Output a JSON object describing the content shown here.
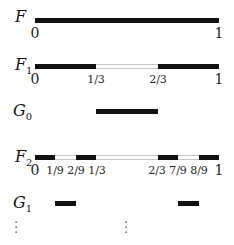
{
  "rows": {
    "F": {
      "label": "F",
      "sub": ""
    },
    "F1": {
      "label": "F",
      "sub": "1"
    },
    "G0": {
      "label": "G",
      "sub": "0"
    },
    "F2": {
      "label": "F",
      "sub": "2"
    },
    "G1": {
      "label": "G",
      "sub": "1"
    }
  },
  "ticks": {
    "F": [
      "0",
      "1"
    ],
    "F1": [
      "0",
      "1/3",
      "2/3",
      "1"
    ],
    "F2": [
      "0",
      "1/9",
      "2/9",
      "1/3",
      "2/3",
      "7/9",
      "8/9",
      "1"
    ]
  },
  "segments": {
    "F": [
      [
        0,
        1
      ]
    ],
    "F1": [
      [
        0,
        0.3333
      ],
      [
        0.6667,
        1
      ]
    ],
    "G0": [
      [
        0.3333,
        0.6667
      ]
    ],
    "F2": [
      [
        0,
        0.1111
      ],
      [
        0.2222,
        0.3333
      ],
      [
        0.6667,
        0.7778
      ],
      [
        0.8889,
        1
      ]
    ],
    "G1": [
      [
        0.1111,
        0.2222
      ],
      [
        0.7778,
        0.8889
      ]
    ]
  },
  "ellipsis": "⋮"
}
